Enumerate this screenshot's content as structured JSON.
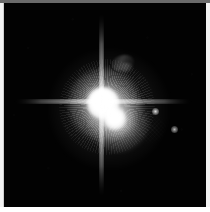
{
  "image": {
    "title": "Pluto and Charon with small moons",
    "subject": "Pluto-Charon system",
    "capture_style": "telescope long-exposure, grayscale",
    "width_px": 210,
    "height_px": 212,
    "background_color": "#020202",
    "frame_color": "#f2f2f2",
    "frame_edge_color": "#6a6a6a",
    "source_color": "#ffffff"
  },
  "frame": {
    "top_rule_label": "frame-top-edge",
    "left_rule_label": "frame-left-edge",
    "right_rule_label": "frame-right-edge",
    "bottom_rule_label": "frame-bottom-edge"
  },
  "sky": {
    "label": "night-sky-field",
    "left": 4,
    "top": 3,
    "width": 202,
    "height": 204
  },
  "objects": [
    {
      "name": "Pluto",
      "role": "primary",
      "cx": 101,
      "cy": 102,
      "core_radius": 13,
      "brightness": 1.0,
      "color": "#ffffff"
    },
    {
      "name": "Charon",
      "role": "secondary",
      "cx": 114,
      "cy": 119,
      "core_radius": 9,
      "brightness": 0.88,
      "color": "#ffffff"
    },
    {
      "name": "Nix",
      "role": "moon",
      "cx": 155,
      "cy": 112,
      "core_radius": 2,
      "brightness": 0.42,
      "color": "#e8e8e8"
    },
    {
      "name": "Hydra",
      "role": "moon",
      "cx": 174,
      "cy": 130,
      "core_radius": 2,
      "brightness": 0.36,
      "color": "#dedede"
    }
  ],
  "features": {
    "vertical_spike": {
      "label": "vertical-diffraction-spike",
      "length": 186,
      "width": 5
    },
    "horizontal_spike": {
      "label": "horizontal-diffraction-spike",
      "length": 178,
      "width": 5
    },
    "halo": {
      "label": "primary-glow-halo",
      "radius": 46
    },
    "corona": {
      "label": "radial-speckle-corona",
      "radius": 44
    },
    "artifact_patch": {
      "label": "detector-checkerboard-artifact",
      "cx": 140,
      "cy": 126,
      "width": 40,
      "height": 28
    },
    "wisp": {
      "label": "faint-wisp-streak",
      "cx": 122,
      "cy": 62
    },
    "noise": {
      "label": "background-detector-noise"
    }
  }
}
